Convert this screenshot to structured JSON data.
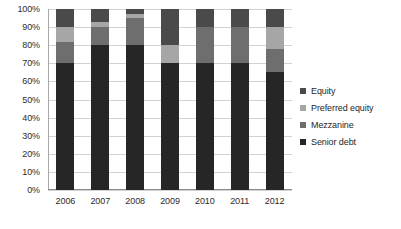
{
  "chart_data": {
    "type": "bar",
    "subtype": "stacked-100-percent",
    "title": "",
    "xlabel": "",
    "ylabel": "",
    "categories": [
      "2006",
      "2007",
      "2008",
      "2009",
      "2010",
      "2011",
      "2012"
    ],
    "ylim": [
      0,
      100
    ],
    "ytick_labels": [
      "0%",
      "10%",
      "20%",
      "30%",
      "40%",
      "50%",
      "60%",
      "70%",
      "80%",
      "90%",
      "100%"
    ],
    "ytick_values": [
      0,
      10,
      20,
      30,
      40,
      50,
      60,
      70,
      80,
      90,
      100
    ],
    "grid": "horizontal",
    "legend_position": "right",
    "stack_order_bottom_to_top": [
      "Senior debt",
      "Mezzanine",
      "Preferred equity",
      "Equity"
    ],
    "series": [
      {
        "name": "Senior debt",
        "color": "#262626",
        "values": [
          70,
          80,
          80,
          70,
          70,
          70,
          65
        ]
      },
      {
        "name": "Mezzanine",
        "color": "#6e6e6e",
        "values": [
          12,
          10,
          15,
          0,
          20,
          20,
          13
        ]
      },
      {
        "name": "Preferred equity",
        "color": "#a6a6a6",
        "values": [
          8,
          3,
          2,
          10,
          0,
          0,
          12
        ]
      },
      {
        "name": "Equity",
        "color": "#4a4a4a",
        "values": [
          10,
          7,
          3,
          20,
          10,
          10,
          10
        ]
      }
    ]
  },
  "legend": {
    "items": [
      {
        "label": "Equity",
        "color": "#4a4a4a"
      },
      {
        "label": "Preferred equity",
        "color": "#a6a6a6"
      },
      {
        "label": "Mezzanine",
        "color": "#6e6e6e"
      },
      {
        "label": "Senior debt",
        "color": "#262626"
      }
    ]
  }
}
